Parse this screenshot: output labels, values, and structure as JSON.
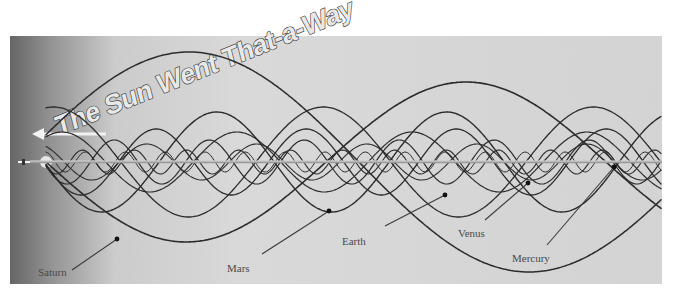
{
  "diagram": {
    "title": "The Sun Went That-a-Way",
    "direction_arrow": "arrow-left-icon",
    "colors": {
      "background": "#ffffff",
      "panel_light": "#dcdcdc",
      "panel_dark": "#5a5a5a",
      "curve": "#2b2b2b",
      "label": "#4a4a4a"
    },
    "planets": [
      {
        "name": "Saturn",
        "label": "Saturn",
        "label_x": 38,
        "label_y": 276,
        "marker_x": 117,
        "marker_y": 239,
        "leader_from_x": 72,
        "leader_from_y": 270
      },
      {
        "name": "Mars",
        "label": "Mars",
        "label_x": 227,
        "label_y": 272,
        "marker_x": 329,
        "marker_y": 211,
        "leader_from_x": 262,
        "leader_from_y": 254
      },
      {
        "name": "Earth",
        "label": "Earth",
        "label_x": 342,
        "label_y": 245,
        "marker_x": 445,
        "marker_y": 195,
        "leader_from_x": 385,
        "leader_from_y": 226
      },
      {
        "name": "Venus",
        "label": "Venus",
        "label_x": 458,
        "label_y": 237,
        "marker_x": 528,
        "marker_y": 183,
        "leader_from_x": 485,
        "leader_from_y": 220
      },
      {
        "name": "Mercury",
        "label": "Mercury",
        "label_x": 512,
        "label_y": 262,
        "marker_x": 614,
        "marker_y": 167,
        "leader_from_x": 547,
        "leader_from_y": 245
      }
    ]
  }
}
